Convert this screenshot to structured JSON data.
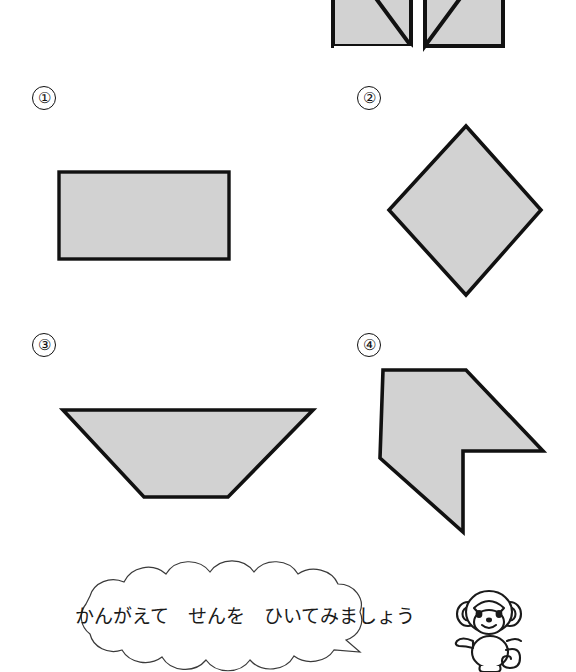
{
  "worksheet": {
    "language": "ja",
    "instruction_text": "かんがえて　せんを　ひいてみましょう",
    "mascot": "monkey-character",
    "colors": {
      "shape_fill": "#d2d2d2",
      "shape_stroke": "#111111",
      "page_background": "#ffffff",
      "bubble_stroke": "#3a3a3a",
      "bubble_fill": "#ffffff"
    },
    "example": {
      "name": "example-shape",
      "description": "butterfly-split-squares",
      "label": ""
    },
    "problems": [
      {
        "number": "①",
        "name": "rectangle",
        "shape_type": "rectangle"
      },
      {
        "number": "②",
        "name": "diamond",
        "shape_type": "square-rotated"
      },
      {
        "number": "③",
        "name": "trapezoid",
        "shape_type": "trapezoid"
      },
      {
        "number": "④",
        "name": "arrow-polygon",
        "shape_type": "concave-polygon"
      }
    ]
  }
}
